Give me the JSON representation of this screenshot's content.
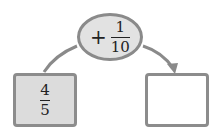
{
  "operator": {
    "sign": "+",
    "numerator": "1",
    "denominator": "10"
  },
  "input_box": {
    "numerator": "4",
    "denominator": "5"
  },
  "output_box": {
    "value": ""
  },
  "colors": {
    "stroke": "#8a8a8a",
    "fill_gray": "#dcdcdc"
  }
}
